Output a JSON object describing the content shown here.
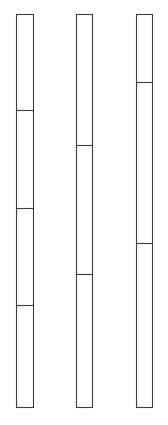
{
  "canvas": {
    "width": 168,
    "height": 425,
    "background_color": "#ffffff"
  },
  "style": {
    "stroke_color": "#3c3c3c",
    "stroke_width": 1.1,
    "fill_color": "#ffffff"
  },
  "chart_data": {
    "type": "bar",
    "orientation": "vertical",
    "stacked": true,
    "title": "",
    "subtitle": "",
    "xlabel": "",
    "ylabel": "",
    "grid": false,
    "legend": null,
    "axis_visible": false,
    "tick_labels": [],
    "categories": [
      "Bar 1",
      "Bar 2",
      "Bar 3"
    ],
    "y_top_px": 14,
    "y_bottom_px": 408,
    "total_height_px": 394,
    "bars": [
      {
        "name": "Bar 1",
        "x_left_px": 16,
        "x_right_px": 34,
        "width_px": 18,
        "segment_count": 4,
        "divider_y_px": [
          110,
          208,
          305
        ],
        "segments": [
          {
            "index": 1,
            "top_px": 14,
            "bottom_px": 110,
            "height_px": 96,
            "fraction": 0.244
          },
          {
            "index": 2,
            "top_px": 110,
            "bottom_px": 208,
            "height_px": 98,
            "fraction": 0.249
          },
          {
            "index": 3,
            "top_px": 208,
            "bottom_px": 305,
            "height_px": 97,
            "fraction": 0.246
          },
          {
            "index": 4,
            "top_px": 305,
            "bottom_px": 408,
            "height_px": 103,
            "fraction": 0.261
          }
        ]
      },
      {
        "name": "Bar 2",
        "x_left_px": 76,
        "x_right_px": 93,
        "width_px": 17,
        "segment_count": 3,
        "divider_y_px": [
          145,
          274
        ],
        "segments": [
          {
            "index": 1,
            "top_px": 14,
            "bottom_px": 145,
            "height_px": 131,
            "fraction": 0.332
          },
          {
            "index": 2,
            "top_px": 145,
            "bottom_px": 274,
            "height_px": 129,
            "fraction": 0.327
          },
          {
            "index": 3,
            "top_px": 274,
            "bottom_px": 408,
            "height_px": 134,
            "fraction": 0.34
          }
        ]
      },
      {
        "name": "Bar 3",
        "x_left_px": 136,
        "x_right_px": 153,
        "width_px": 17,
        "segment_count": 3,
        "divider_y_px": [
          82,
          243
        ],
        "segments": [
          {
            "index": 1,
            "top_px": 14,
            "bottom_px": 82,
            "height_px": 68,
            "fraction": 0.173
          },
          {
            "index": 2,
            "top_px": 82,
            "bottom_px": 243,
            "height_px": 161,
            "fraction": 0.409
          },
          {
            "index": 3,
            "top_px": 243,
            "bottom_px": 408,
            "height_px": 165,
            "fraction": 0.419
          }
        ]
      }
    ]
  }
}
